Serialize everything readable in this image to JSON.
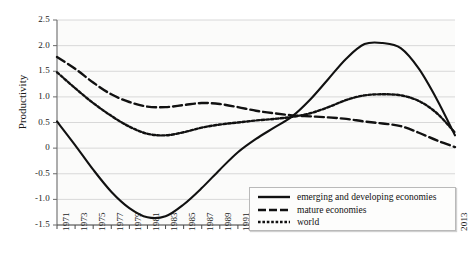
{
  "chart_data": {
    "type": "line",
    "title": "",
    "xlabel": "",
    "ylabel": "Productivity",
    "ylim": [
      -1.5,
      2.5
    ],
    "yticks": [
      "2.5",
      "2.0",
      "1.5",
      "1.0",
      "0.5",
      "0",
      "-0.5",
      "-1.0",
      "-1.5"
    ],
    "ytick_values": [
      2.5,
      2.0,
      1.5,
      1.0,
      0.5,
      0,
      -0.5,
      -1.0,
      -1.5
    ],
    "grid": true,
    "legend_position": "bottom-right",
    "xticks": [
      "1971",
      "1973",
      "1975",
      "1977",
      "1979",
      "1981",
      "1983",
      "1985",
      "1987",
      "1989",
      "1991",
      "1993",
      "1995",
      "1997",
      "1999",
      "2001",
      "2003",
      "2005",
      "2006",
      "2007",
      "2009",
      "2011",
      "2013"
    ],
    "x": [
      1971,
      1973,
      1975,
      1977,
      1979,
      1981,
      1983,
      1985,
      1987,
      1989,
      1991,
      1993,
      1995,
      1997,
      1999,
      2001,
      2003,
      2005,
      2006,
      2007,
      2009,
      2011,
      2013
    ],
    "series": [
      {
        "name": "emerging and developing economies",
        "style": "solid",
        "values": [
          0.52,
          0.06,
          -0.42,
          -0.85,
          -1.17,
          -1.35,
          -1.33,
          -1.1,
          -0.78,
          -0.42,
          -0.08,
          0.18,
          0.4,
          0.62,
          0.95,
          1.35,
          1.75,
          2.03,
          2.05,
          1.95,
          1.55,
          0.95,
          0.25
        ]
      },
      {
        "name": "mature economies",
        "style": "dashed",
        "values": [
          1.78,
          1.55,
          1.28,
          1.05,
          0.9,
          0.81,
          0.8,
          0.84,
          0.88,
          0.86,
          0.8,
          0.73,
          0.68,
          0.64,
          0.62,
          0.6,
          0.57,
          0.52,
          0.48,
          0.43,
          0.3,
          0.15,
          0.02
        ]
      },
      {
        "name": "world",
        "style": "dotted",
        "values": [
          1.48,
          1.17,
          0.88,
          0.63,
          0.42,
          0.28,
          0.25,
          0.31,
          0.4,
          0.46,
          0.5,
          0.54,
          0.57,
          0.61,
          0.68,
          0.8,
          0.94,
          1.03,
          1.05,
          1.03,
          0.92,
          0.68,
          0.3
        ]
      }
    ]
  },
  "legend": {
    "items": [
      {
        "label": "emerging and developing economies",
        "style": "solid"
      },
      {
        "label": "mature economies",
        "style": "dashed"
      },
      {
        "label": "world",
        "style": "dotted"
      }
    ]
  }
}
